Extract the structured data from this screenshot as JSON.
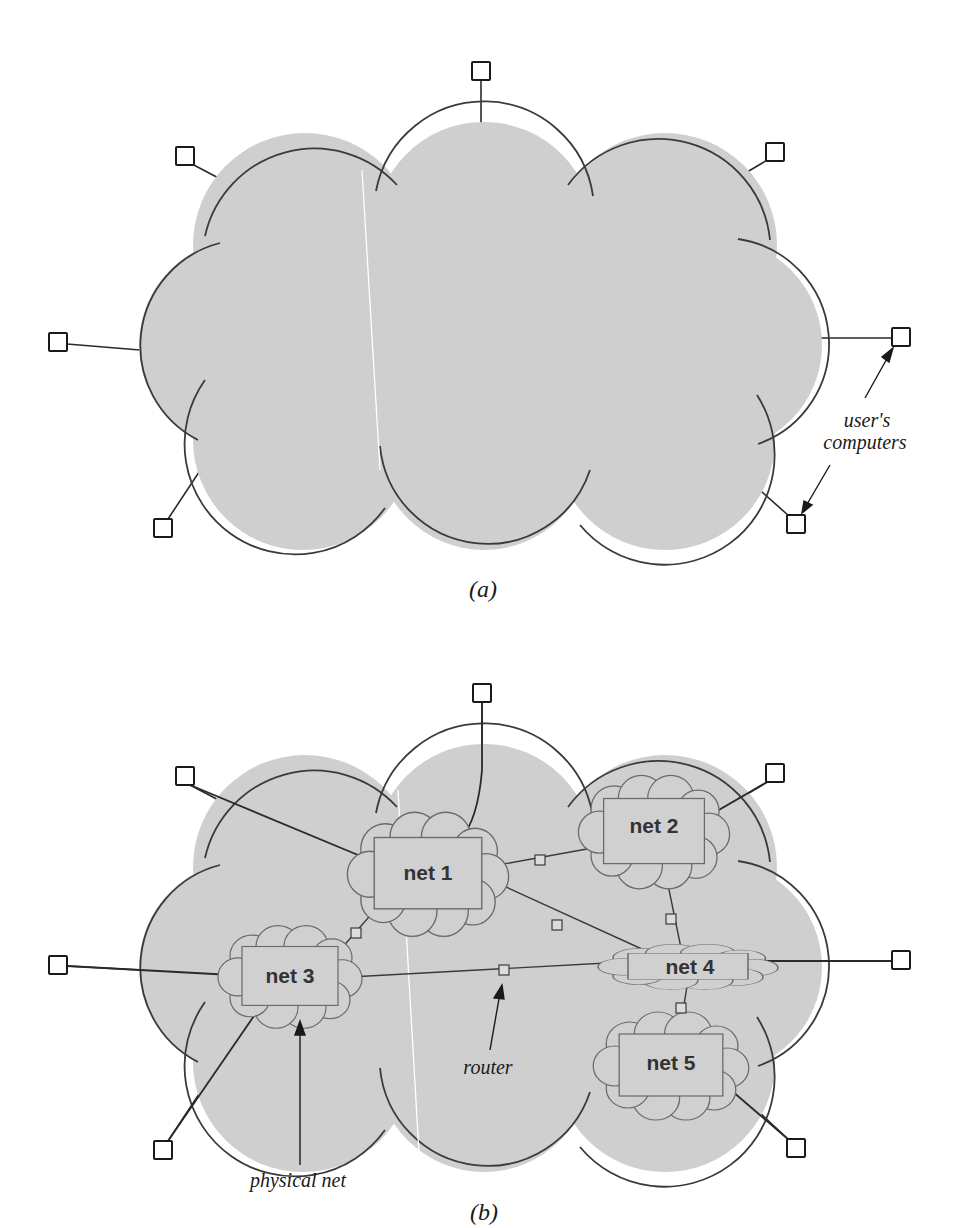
{
  "colors": {
    "cloud_fill": "#cfcfcf",
    "cloud_stroke": "#3a3a3a",
    "small_cloud_stroke": "#6a6a6a",
    "line": "#2a2a2a",
    "computer_fill": "#ffffff",
    "router_fill": "#d8d8d8"
  },
  "figure_a": {
    "caption": "(a)",
    "annotation": {
      "line1": "user's",
      "line2": "computers"
    },
    "computers": [
      {
        "id": "top",
        "x": 481,
        "y": 71
      },
      {
        "id": "top-left",
        "x": 185,
        "y": 156
      },
      {
        "id": "top-right",
        "x": 775,
        "y": 152
      },
      {
        "id": "left",
        "x": 58,
        "y": 342
      },
      {
        "id": "right",
        "x": 901,
        "y": 337
      },
      {
        "id": "bottom-left",
        "x": 163,
        "y": 528
      },
      {
        "id": "bottom-right",
        "x": 796,
        "y": 524
      }
    ]
  },
  "figure_b": {
    "caption": "(b)",
    "annotations": {
      "router": "router",
      "physical_net": "physical net"
    },
    "networks": [
      {
        "id": "net1",
        "label": "net 1",
        "x": 428,
        "y": 866
      },
      {
        "id": "net2",
        "label": "net 2",
        "x": 654,
        "y": 826
      },
      {
        "id": "net3",
        "label": "net 3",
        "x": 290,
        "y": 975
      },
      {
        "id": "net4",
        "label": "net 4",
        "x": 690,
        "y": 966
      },
      {
        "id": "net5",
        "label": "net 5",
        "x": 671,
        "y": 1062
      }
    ],
    "routers": [
      {
        "between": "net1-net2",
        "x": 540,
        "y": 860
      },
      {
        "between": "net1-net4",
        "x": 557,
        "y": 925
      },
      {
        "between": "net1-net3",
        "x": 356,
        "y": 933
      },
      {
        "between": "net2-net4",
        "x": 671,
        "y": 919
      },
      {
        "between": "net3-net4",
        "x": 504,
        "y": 970
      },
      {
        "between": "net4-net5",
        "x": 681,
        "y": 1008
      }
    ],
    "computers": [
      {
        "id": "top",
        "x": 481,
        "y": 693
      },
      {
        "id": "top-left",
        "x": 185,
        "y": 776
      },
      {
        "id": "top-right",
        "x": 775,
        "y": 773
      },
      {
        "id": "left",
        "x": 58,
        "y": 965
      },
      {
        "id": "right",
        "x": 901,
        "y": 960
      },
      {
        "id": "bottom-left",
        "x": 163,
        "y": 1150
      },
      {
        "id": "bottom-right",
        "x": 796,
        "y": 1148
      }
    ]
  }
}
